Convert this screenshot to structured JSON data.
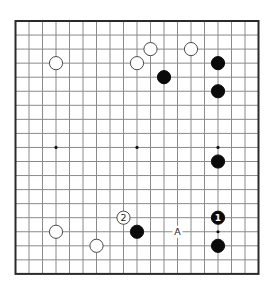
{
  "board": {
    "size": 19,
    "left": 15.5,
    "top": 21,
    "cell_w": 13.5,
    "cell_h": 14.05,
    "stone_radius": 6.6,
    "line_color": "#8a8a8a",
    "border_color": "#2a2a2a",
    "star_points": [
      [
        3,
        9
      ],
      [
        9,
        9
      ],
      [
        15,
        9
      ],
      [
        15,
        15
      ]
    ],
    "stones": [
      {
        "color": "white",
        "col": 3,
        "row": 3,
        "label": ""
      },
      {
        "color": "white",
        "col": 10,
        "row": 2,
        "label": ""
      },
      {
        "color": "white",
        "col": 9,
        "row": 3,
        "label": ""
      },
      {
        "color": "white",
        "col": 13,
        "row": 2,
        "label": ""
      },
      {
        "color": "black",
        "col": 15,
        "row": 3,
        "label": ""
      },
      {
        "color": "black",
        "col": 11,
        "row": 4,
        "label": ""
      },
      {
        "color": "black",
        "col": 15,
        "row": 5,
        "label": ""
      },
      {
        "color": "black",
        "col": 15,
        "row": 10,
        "label": ""
      },
      {
        "color": "black",
        "col": 15,
        "row": 14,
        "label": "1"
      },
      {
        "color": "black",
        "col": 15,
        "row": 16,
        "label": ""
      },
      {
        "color": "white",
        "col": 8,
        "row": 14,
        "label": "2"
      },
      {
        "color": "black",
        "col": 9,
        "row": 15,
        "label": ""
      },
      {
        "color": "white",
        "col": 3,
        "row": 15,
        "label": ""
      },
      {
        "color": "white",
        "col": 6,
        "row": 16,
        "label": ""
      }
    ],
    "marks": [
      {
        "col": 12,
        "row": 15,
        "text": "A"
      }
    ]
  }
}
